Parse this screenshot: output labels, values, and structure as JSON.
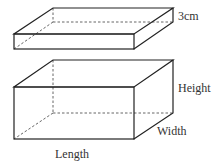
{
  "diagram": {
    "type": "3d-shapes",
    "colors": {
      "line": "#222222",
      "hidden_line": "#555555",
      "text": "#333333",
      "background": "#ffffff"
    },
    "top_slab": {
      "name": "thin slab",
      "thickness_label": "3cm"
    },
    "bottom_box": {
      "name": "cuboid",
      "height_label": "Height",
      "width_label": "Width",
      "length_label": "Length"
    }
  }
}
